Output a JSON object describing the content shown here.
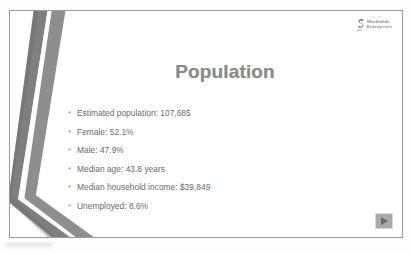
{
  "slide": {
    "title": "Population",
    "logo": {
      "mark": "swoosh-e-icon",
      "line1": "Worldwide",
      "line2": "Enterprises"
    },
    "bullet_glyph": "*",
    "bullets": [
      {
        "label": "Estimated population:  107,685"
      },
      {
        "label": "Female: 52.1%"
      },
      {
        "label": "Male: 47.9%"
      },
      {
        "label": "Median age: 43.8 years"
      },
      {
        "label": "Median household income: $39,849"
      },
      {
        "label": "Unemployed:  8.6%"
      }
    ],
    "play_button": {
      "name": "advance-slide-button",
      "glyph": "play-triangle-icon"
    },
    "decoration": {
      "name": "chevron-bands",
      "band_color_dark": "#7d7d7d",
      "band_color_light": "#9c9c9c",
      "count": 2
    },
    "colors": {
      "title": "#8a8a8a",
      "body_text": "#6a6a6a",
      "slide_border": "#9a9a9a",
      "slide_background": "#ffffff",
      "page_background": "#fdfdfd",
      "button_face": "#a9a9a9"
    }
  }
}
